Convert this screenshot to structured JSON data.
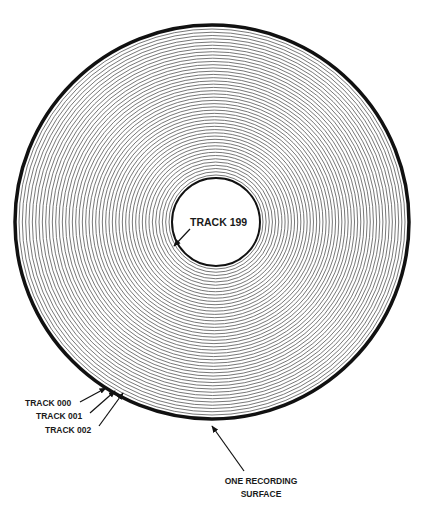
{
  "diagram": {
    "disk": {
      "center": [
        212,
        222
      ],
      "outer_radius": 197,
      "inner_radius": 44,
      "ring_count": 46,
      "edge_color": "#111111",
      "ring_color": "#555555"
    },
    "labels": {
      "track_199": "TRACK 199",
      "track_000": "TRACK 000",
      "track_001": "TRACK 001",
      "track_002": "TRACK 002",
      "surface_line1": "ONE RECORDING",
      "surface_line2": "SURFACE"
    }
  }
}
